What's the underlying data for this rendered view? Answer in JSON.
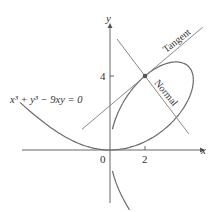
{
  "figure": {
    "equation_label": "x³ + y³ − 9xy = 0",
    "tangent_label": "Tangent",
    "normal_label": "Normal",
    "x_axis_label": "x",
    "y_axis_label": "y",
    "origin_label": "0",
    "x_tick_label": "2",
    "y_tick_label": "4",
    "point": {
      "x": 2,
      "y": 4
    },
    "tangent_slope": 0.8,
    "normal_slope": -1.25,
    "colors": {
      "curve": "#6b6b6b",
      "lines": "#8a8a8a",
      "axes": "#555555",
      "point": "#555555"
    }
  }
}
